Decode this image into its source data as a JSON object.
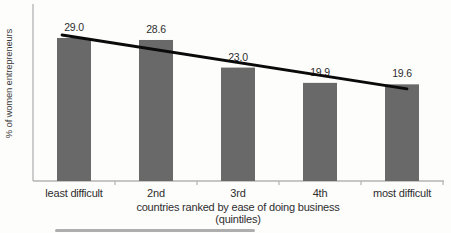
{
  "chart_data": {
    "type": "bar",
    "categories": [
      "least difficult",
      "2nd",
      "3rd",
      "4th",
      "most difficult"
    ],
    "values": [
      29.0,
      28.6,
      23.0,
      19.9,
      19.6
    ],
    "value_labels": [
      "29.0",
      "28.6",
      "23.0",
      "19.9",
      "19.6"
    ],
    "ylabel": "% of women entrepreneurs",
    "xlabel_line1": "countries ranked by ease of doing business",
    "xlabel_line2": "(quintiles)",
    "ylim": [
      0,
      33
    ],
    "grid": false,
    "legend": null,
    "trendline": true,
    "colors": {
      "bar": "#696969",
      "trendline": "#0a0a0a",
      "axis": "#b3b3b3",
      "text": "#2e2e2e"
    }
  }
}
